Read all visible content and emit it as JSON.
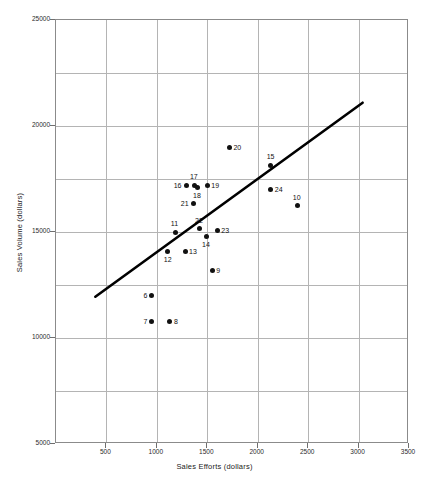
{
  "chart_data": {
    "type": "scatter",
    "title": "",
    "xlabel": "Sales Efforts (dollars)",
    "ylabel": "Sales Volume (dollars)",
    "xlim": [
      0,
      3500
    ],
    "ylim": [
      5000,
      25000
    ],
    "grid": true,
    "x_tick_labels": [
      "500",
      "1000",
      "1500",
      "2000",
      "2500",
      "3000",
      "3500"
    ],
    "x_ticks": [
      500,
      1000,
      1500,
      2000,
      2500,
      3000,
      3500
    ],
    "y_tick_labels": [
      "5000",
      "10000",
      "15000",
      "20000",
      "25000"
    ],
    "y_ticks": [
      5000,
      10000,
      15000,
      20000,
      25000
    ],
    "x_gridlines": [
      500,
      1000,
      1500,
      2000,
      2500,
      3000
    ],
    "y_gridlines": [
      7500,
      10000,
      12500,
      15000,
      17500,
      20000,
      22500
    ],
    "legend": null,
    "point_labels": [
      "6",
      "7",
      "8",
      "9",
      "10",
      "11",
      "12",
      "13",
      "14",
      "15",
      "16",
      "17",
      "18",
      "19",
      "20",
      "21",
      "22",
      "23",
      "24"
    ],
    "points": [
      {
        "label": "6",
        "x": 950,
        "y": 12000,
        "label_pos": "left"
      },
      {
        "label": "7",
        "x": 950,
        "y": 10800,
        "label_pos": "left"
      },
      {
        "label": "8",
        "x": 1130,
        "y": 10800,
        "label_pos": "right"
      },
      {
        "label": "9",
        "x": 1550,
        "y": 13200,
        "label_pos": "right"
      },
      {
        "label": "10",
        "x": 2390,
        "y": 16250,
        "label_pos": "above"
      },
      {
        "label": "11",
        "x": 1180,
        "y": 15000,
        "label_pos": "above"
      },
      {
        "label": "12",
        "x": 1110,
        "y": 14100,
        "label_pos": "below"
      },
      {
        "label": "13",
        "x": 1280,
        "y": 14100,
        "label_pos": "right"
      },
      {
        "label": "14",
        "x": 1490,
        "y": 14800,
        "label_pos": "below"
      },
      {
        "label": "15",
        "x": 2130,
        "y": 18150,
        "label_pos": "above"
      },
      {
        "label": "16",
        "x": 1290,
        "y": 17200,
        "label_pos": "left"
      },
      {
        "label": "17",
        "x": 1370,
        "y": 17200,
        "label_pos": "above"
      },
      {
        "label": "18",
        "x": 1400,
        "y": 17100,
        "label_pos": "below"
      },
      {
        "label": "19",
        "x": 1500,
        "y": 17200,
        "label_pos": "right"
      },
      {
        "label": "20",
        "x": 1720,
        "y": 19000,
        "label_pos": "right"
      },
      {
        "label": "21",
        "x": 1360,
        "y": 16350,
        "label_pos": "left"
      },
      {
        "label": "22",
        "x": 1420,
        "y": 15150,
        "label_pos": "above"
      },
      {
        "label": "23",
        "x": 1600,
        "y": 15050,
        "label_pos": "right"
      },
      {
        "label": "24",
        "x": 2130,
        "y": 17000,
        "label_pos": "right"
      }
    ],
    "trend_line": {
      "x1": 400,
      "y1": 11900,
      "x2": 3050,
      "y2": 21050,
      "color": "#000000",
      "width": 2.6
    },
    "colors": {
      "point": "#111111",
      "grid": "#b4b4b4",
      "axis": "#8b8b8b",
      "text": "#1a1a1a",
      "background": "#ffffff"
    }
  }
}
